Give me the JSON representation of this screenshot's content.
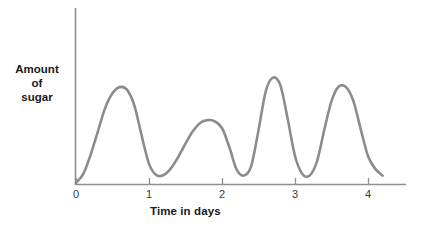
{
  "chart_data": {
    "type": "line",
    "title": "",
    "subtitle": "",
    "xlabel": "Time in days",
    "ylabel": "Amount of sugar",
    "ylabel_lines": [
      "Amount",
      "of",
      "sugar"
    ],
    "xticks": [
      "0",
      "1",
      "2",
      "3",
      "4"
    ],
    "xtick_values": [
      0,
      1,
      2,
      3,
      4
    ],
    "yticks": [],
    "xlim": [
      0,
      4.5
    ],
    "ylim": [
      0,
      1
    ],
    "grid": false,
    "legend": null,
    "annotations": [],
    "series": [
      {
        "name": "Amount of sugar",
        "color": "#8c8c8c",
        "line_width": 2.6,
        "x": [
          0.0,
          0.1,
          0.2,
          0.3,
          0.4,
          0.5,
          0.6,
          0.7,
          0.8,
          0.9,
          1.0,
          1.1,
          1.2,
          1.3,
          1.4,
          1.5,
          1.6,
          1.7,
          1.8,
          1.9,
          2.0,
          2.1,
          2.2,
          2.3,
          2.4,
          2.5,
          2.6,
          2.7,
          2.8,
          2.9,
          3.0,
          3.1,
          3.2,
          3.3,
          3.4,
          3.5,
          3.6,
          3.7,
          3.8,
          3.9,
          4.0,
          4.1,
          4.2
        ],
        "y": [
          0.01,
          0.09,
          0.26,
          0.47,
          0.68,
          0.81,
          0.865,
          0.84,
          0.7,
          0.43,
          0.18,
          0.08,
          0.08,
          0.14,
          0.24,
          0.36,
          0.47,
          0.545,
          0.57,
          0.56,
          0.5,
          0.33,
          0.13,
          0.075,
          0.16,
          0.48,
          0.83,
          0.95,
          0.88,
          0.58,
          0.25,
          0.09,
          0.075,
          0.2,
          0.48,
          0.74,
          0.87,
          0.865,
          0.74,
          0.49,
          0.25,
          0.135,
          0.075
        ]
      }
    ]
  },
  "axes": {
    "x_axis_color": "#8f8f8f",
    "y_axis_color": "#8f8f8f",
    "tick_color": "#8f8f8f",
    "text_color": "#1a1a1a"
  }
}
